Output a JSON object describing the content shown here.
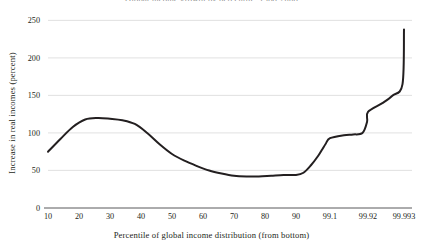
{
  "chart_data": {
    "type": "line",
    "title": "Global income growth by percentile, 1988-2008",
    "xlabel": "Percentile of global income distribution (from bottom)",
    "ylabel": "Increase in real incomes (percent)",
    "xtick_labels": [
      "10",
      "20",
      "30",
      "40",
      "50",
      "60",
      "70",
      "80",
      "90",
      "99.1",
      "99.92",
      "99.993"
    ],
    "ytick_labels": [
      "0",
      "50",
      "100",
      "150",
      "200",
      "250"
    ],
    "ylim": [
      0,
      250
    ],
    "grid": true,
    "legend": "none",
    "series": [
      {
        "name": "Increase in real income",
        "x": [
          "10",
          "14",
          "18",
          "22",
          "26",
          "30",
          "34",
          "38",
          "42",
          "46",
          "50",
          "54",
          "58",
          "62",
          "66",
          "70",
          "74",
          "78",
          "82",
          "86",
          "90",
          "92",
          "94",
          "96",
          "97",
          "98",
          "99.1",
          "99.4",
          "99.6",
          "99.8",
          "99.9",
          "99.92",
          "99.95",
          "99.97",
          "99.99",
          "99.993"
        ],
        "values": [
          75,
          92,
          108,
          118,
          120,
          119,
          117,
          112,
          100,
          85,
          72,
          63,
          56,
          50,
          46,
          43,
          42,
          42,
          43,
          44,
          44,
          47,
          57,
          70,
          78,
          86,
          93,
          97,
          98,
          100,
          115,
          128,
          140,
          150,
          165,
          238
        ]
      }
    ]
  }
}
